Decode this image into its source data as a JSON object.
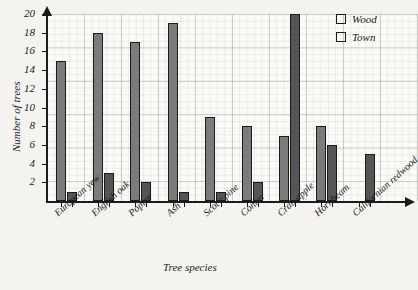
{
  "chart_data": {
    "type": "bar",
    "title": "",
    "xlabel": "Tree species",
    "ylabel": "Number of trees",
    "ylim": [
      0,
      20
    ],
    "yticks": [
      2,
      4,
      6,
      8,
      10,
      12,
      14,
      16,
      18,
      20
    ],
    "grid": true,
    "legend_position": "top-right",
    "categories": [
      "European yew",
      "English oak",
      "Poplar",
      "Ash",
      "Scot's pine",
      "Conker",
      "Crab apple",
      "Hornbeam",
      "Californian redwood"
    ],
    "series": [
      {
        "name": "Wood",
        "color": "#7b7b7b",
        "values": [
          15,
          18,
          17,
          19,
          9,
          8,
          7,
          8,
          0
        ]
      },
      {
        "name": "Town",
        "color": "#555555",
        "values": [
          1,
          3,
          2,
          1,
          1,
          2,
          20,
          6,
          5
        ]
      }
    ]
  },
  "legend": {
    "items": [
      {
        "label": "Wood",
        "color": "#7b7b7b"
      },
      {
        "label": "Town",
        "color": "#555555"
      }
    ]
  },
  "axes": {
    "y_title": "Number of trees",
    "x_title": "Tree species",
    "y_tick_labels": [
      "2",
      "4",
      "6",
      "8",
      "10",
      "12",
      "14",
      "16",
      "18",
      "20"
    ]
  }
}
